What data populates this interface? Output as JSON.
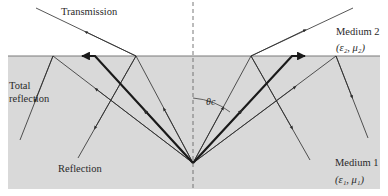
{
  "figure": {
    "colors": {
      "background": "#ffffff",
      "medium1_fill": "#d9d9d9",
      "interface_line": "#7a7a7a",
      "ray": "#2b2b2b",
      "normal_dashed": "#6a6a6a"
    }
  },
  "labels": {
    "transmission": "Transmission",
    "total_reflection_line1": "Total",
    "total_reflection_line2": "reflection",
    "reflection": "Reflection",
    "medium2_name": "Medium 2",
    "medium2_params": "(ε₂, μ₂)",
    "medium1_name": "Medium 1",
    "medium1_params": "(ε₁, μ₁)",
    "critical_angle": "θc"
  }
}
